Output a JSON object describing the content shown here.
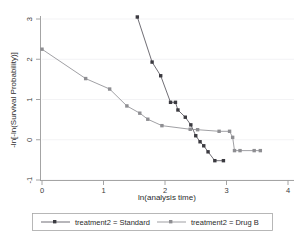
{
  "chart_data": {
    "type": "line",
    "title": "",
    "xlabel": "ln(analysis time)",
    "ylabel": "-ln[-ln(Survival Probability)]",
    "xlim": [
      -0.1,
      4.15
    ],
    "ylim": [
      -1.25,
      3.2
    ],
    "xticks": [
      0,
      1,
      2,
      3,
      4
    ],
    "xtick_labels": [
      "0",
      "1",
      "2",
      "3",
      "4"
    ],
    "yticks": [
      -1,
      0,
      1,
      2,
      3
    ],
    "ytick_labels": [
      "-1",
      "0",
      "1",
      "2",
      "3"
    ],
    "grid": true,
    "grid_axis": "y",
    "legend_position": "bottom",
    "series": [
      {
        "name": "treatment2 = Standard",
        "color": "#3b3a40",
        "marker": "square",
        "points": [
          [
            1.55,
            3.05
          ],
          [
            1.79,
            1.93
          ],
          [
            1.93,
            1.59
          ],
          [
            2.09,
            0.93
          ],
          [
            2.17,
            0.93
          ],
          [
            2.21,
            0.74
          ],
          [
            2.33,
            0.56
          ],
          [
            2.42,
            0.37
          ],
          [
            2.5,
            0.1
          ],
          [
            2.57,
            -0.05
          ],
          [
            2.63,
            -0.15
          ],
          [
            2.7,
            -0.3
          ],
          [
            2.81,
            -0.52
          ],
          [
            2.95,
            -0.52
          ]
        ]
      },
      {
        "name": "treatment2 = Drug B",
        "color": "#8e8e92",
        "marker": "square",
        "points": [
          [
            0.0,
            2.25
          ],
          [
            0.71,
            1.52
          ],
          [
            1.1,
            1.26
          ],
          [
            1.38,
            0.84
          ],
          [
            1.59,
            0.66
          ],
          [
            1.72,
            0.51
          ],
          [
            1.95,
            0.35
          ],
          [
            2.41,
            0.26
          ],
          [
            2.53,
            0.25
          ],
          [
            2.88,
            0.21
          ],
          [
            3.05,
            0.21
          ],
          [
            3.1,
            0.06
          ],
          [
            3.13,
            -0.27
          ],
          [
            3.22,
            -0.27
          ],
          [
            3.45,
            -0.27
          ],
          [
            3.55,
            -0.27
          ]
        ]
      }
    ]
  },
  "legend": {
    "entries": [
      {
        "label": "treatment2 = Standard"
      },
      {
        "label": "treatment2 = Drug B"
      }
    ]
  }
}
